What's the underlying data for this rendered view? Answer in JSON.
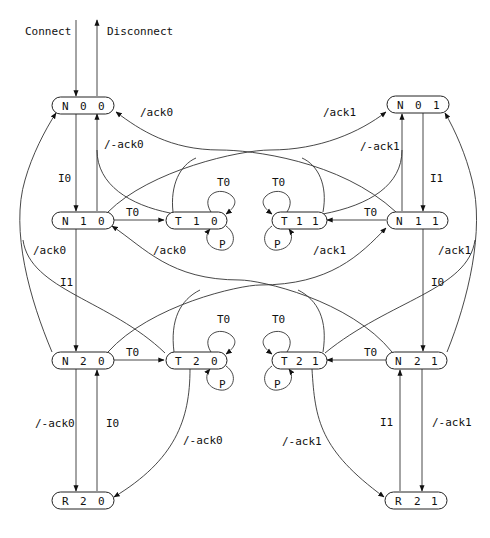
{
  "diagram": {
    "type": "state-machine",
    "external": {
      "connect": "Connect",
      "disconnect": "Disconnect"
    },
    "nodes": {
      "N00": {
        "a": "N",
        "b": "0",
        "c": "0"
      },
      "N01": {
        "a": "N",
        "b": "0",
        "c": "1"
      },
      "N10": {
        "a": "N",
        "b": "1",
        "c": "0"
      },
      "T10": {
        "a": "T",
        "b": "1",
        "c": "0"
      },
      "T11": {
        "a": "T",
        "b": "1",
        "c": "1"
      },
      "N11": {
        "a": "N",
        "b": "1",
        "c": "1"
      },
      "N20": {
        "a": "N",
        "b": "2",
        "c": "0"
      },
      "T20": {
        "a": "T",
        "b": "2",
        "c": "0"
      },
      "T21": {
        "a": "T",
        "b": "2",
        "c": "1"
      },
      "N21": {
        "a": "N",
        "b": "2",
        "c": "1"
      },
      "R20": {
        "a": "R",
        "b": "2",
        "c": "0"
      },
      "R21": {
        "a": "R",
        "b": "2",
        "c": "1"
      }
    },
    "edges": [
      {
        "from": "external",
        "to": "N00",
        "label": "Connect"
      },
      {
        "from": "N00",
        "to": "external",
        "label": "Disconnect"
      },
      {
        "from": "N00",
        "to": "N10",
        "label": "I0"
      },
      {
        "from": "N10",
        "to": "N00",
        "label": "/-ack0"
      },
      {
        "from": "T11",
        "to": "N00",
        "label": "/ack0"
      },
      {
        "from": "N10",
        "to": "T10",
        "label": "T0"
      },
      {
        "from": "T10",
        "to": "T10",
        "label": "T0"
      },
      {
        "from": "T10",
        "to": "T10",
        "label": "P"
      },
      {
        "from": "N10",
        "to": "N20",
        "label": "I1"
      },
      {
        "from": "N20",
        "to": "N00",
        "label": "/ack0"
      },
      {
        "from": "T21",
        "to": "N10",
        "label": "/ack0"
      },
      {
        "from": "N01",
        "to": "N11",
        "label": "I1"
      },
      {
        "from": "N11",
        "to": "N01",
        "label": "/-ack1"
      },
      {
        "from": "T10",
        "to": "N01",
        "label": "/ack1"
      },
      {
        "from": "N11",
        "to": "T11",
        "label": "T0"
      },
      {
        "from": "T11",
        "to": "T11",
        "label": "T0"
      },
      {
        "from": "T11",
        "to": "T11",
        "label": "P"
      },
      {
        "from": "N11",
        "to": "N21",
        "label": "I0"
      },
      {
        "from": "N21",
        "to": "N01",
        "label": "/ack1"
      },
      {
        "from": "T20",
        "to": "N11",
        "label": "/ack1"
      },
      {
        "from": "N20",
        "to": "T20",
        "label": "T0"
      },
      {
        "from": "T20",
        "to": "T20",
        "label": "T0"
      },
      {
        "from": "T20",
        "to": "T20",
        "label": "P"
      },
      {
        "from": "N20",
        "to": "R20",
        "label": "/-ack0"
      },
      {
        "from": "R20",
        "to": "N20",
        "label": "I0"
      },
      {
        "from": "T20",
        "to": "R20",
        "label": "/-ack0"
      },
      {
        "from": "N21",
        "to": "T21",
        "label": "T0"
      },
      {
        "from": "T21",
        "to": "T21",
        "label": "T0"
      },
      {
        "from": "T21",
        "to": "T21",
        "label": "P"
      },
      {
        "from": "N21",
        "to": "R21",
        "label": "/-ack1"
      },
      {
        "from": "R21",
        "to": "N21",
        "label": "I1"
      },
      {
        "from": "T21",
        "to": "R21",
        "label": "/-ack1"
      }
    ],
    "labels": {
      "connect": "Connect",
      "disconnect": "Disconnect",
      "n00_n10": "I0",
      "n10_n00": "/-ack0",
      "to_n00_top": "/ack0",
      "to_n01_top": "/ack1",
      "n11_n01": "/-ack1",
      "n01_n11": "I1",
      "n10_t10": "T0",
      "n11_t11": "T0",
      "t10_loop_t": "T0",
      "t10_loop_p": "P",
      "t11_loop_t": "T0",
      "t11_loop_p": "P",
      "n20_n00": "/ack0",
      "t21_n10": "/ack0",
      "t20_n11": "/ack1",
      "n21_n01": "/ack1",
      "n10_n20": "I1",
      "n11_n21": "I0",
      "n20_t20": "T0",
      "n21_t21": "T0",
      "t20_loop_t": "T0",
      "t20_loop_p": "P",
      "t21_loop_t": "T0",
      "t21_loop_p": "P",
      "n20_r20": "/-ack0",
      "r20_n20": "I0",
      "t20_r20": "/-ack0",
      "t21_r21": "/-ack1",
      "r21_n21": "I1",
      "n21_r21": "/-ack1"
    }
  }
}
